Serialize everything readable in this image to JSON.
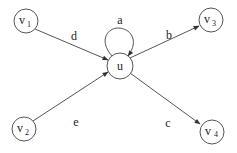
{
  "diagram": {
    "type": "directed-graph",
    "nodes": [
      {
        "id": "v1",
        "label": "v",
        "subscript": "1"
      },
      {
        "id": "v2",
        "label": "v",
        "subscript": "2"
      },
      {
        "id": "u",
        "label": "u",
        "subscript": ""
      },
      {
        "id": "v3",
        "label": "v",
        "subscript": "3"
      },
      {
        "id": "v4",
        "label": "v",
        "subscript": "4"
      }
    ],
    "edges": [
      {
        "from": "v1",
        "to": "u",
        "label": "d"
      },
      {
        "from": "v2",
        "to": "u",
        "label": "e"
      },
      {
        "from": "u",
        "to": "u",
        "label": "a"
      },
      {
        "from": "u",
        "to": "v3",
        "label": "b"
      },
      {
        "from": "u",
        "to": "v4",
        "label": "c"
      }
    ]
  }
}
